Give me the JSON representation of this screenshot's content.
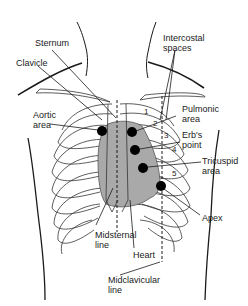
{
  "diagram": {
    "colors": {
      "line": "#1a1a1a",
      "heart_fill": "#a9a9a9",
      "dot": "#000000",
      "background": "#ffffff"
    },
    "labels": {
      "sternum": "Sternum",
      "clavicle": "Clavicle",
      "intercostal": "Intercostal\nspaces",
      "pulmonic": "Pulmonic\narea",
      "aortic": "Aortic\narea",
      "erbs": "Erb's\npoint",
      "tricuspid": "Tricuspid\narea",
      "apex": "Apex",
      "midsternal": "Midsternal\nline",
      "heart": "Heart",
      "midclavicular": "Midclavicular\nline"
    },
    "intercostal_numbers": [
      "1",
      "2",
      "3",
      "4",
      "5"
    ],
    "auscultation_points": [
      {
        "name": "Aortic area",
        "x": 102,
        "y": 131
      },
      {
        "name": "Pulmonic area",
        "x": 132,
        "y": 132
      },
      {
        "name": "Erb's point",
        "x": 135,
        "y": 150
      },
      {
        "name": "Tricuspid area",
        "x": 143,
        "y": 168
      },
      {
        "name": "Apex",
        "x": 161,
        "y": 186
      }
    ]
  }
}
